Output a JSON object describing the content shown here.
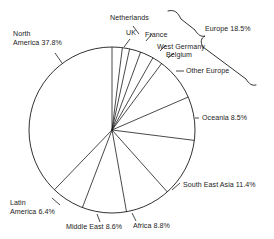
{
  "chart_data": {
    "type": "pie",
    "title": "",
    "subtitle": "",
    "xlabel": "",
    "ylabel": "",
    "legend_position": "none",
    "grid": false,
    "units": "percent",
    "start_angle_deg": 0,
    "direction": "clockwise",
    "categories": [
      "UK",
      "Netherlands",
      "France",
      "West Germany",
      "Belgium",
      "Other Europe",
      "Oceania",
      "South East Asia",
      "Africa",
      "Middle East",
      "Latin America",
      "North America"
    ],
    "values": [
      2.0,
      1.4,
      2.2,
      2.6,
      2.0,
      8.3,
      8.5,
      11.4,
      8.8,
      8.6,
      6.4,
      37.8
    ],
    "total": 100.0,
    "groups": [
      {
        "name": "Europe",
        "value": 18.5,
        "label": "Europe 18.5%",
        "members": [
          "UK",
          "Netherlands",
          "France",
          "West Germany",
          "Belgium",
          "Other Europe"
        ]
      }
    ],
    "annotations": [
      "Netherlands",
      "UK",
      "France",
      "West Germany",
      "Belgium",
      "Other Europe",
      "Europe 18.5%",
      "Oceania 8.5%",
      "South East Asia 11.4%",
      "Africa 8.8%",
      "Middle East 8.6%",
      "Latin America 6.4%",
      "North America 37.8%"
    ]
  },
  "labels": {
    "north_america": "North\nAmerica 37.8%",
    "north_america_line1": "North",
    "north_america_line2": "America 37.8%",
    "netherlands": "Netherlands",
    "uk": "UK",
    "france": "France",
    "west_germany": "West Germany",
    "belgium": "Belgium",
    "other_europe": "Other Europe",
    "europe_group": "Europe 18.5%",
    "oceania": "Oceania 8.5%",
    "south_east_asia": "South East Asia 11.4%",
    "africa": "Africa 8.8%",
    "middle_east": "Middle East 8.6%",
    "latin_america_line1": "Latin",
    "latin_america_line2": "America 6.4%"
  },
  "colors": {
    "background": "#ffffff",
    "stroke": "#1a1a1a",
    "text": "#1c1c1c",
    "slice_fill": "none"
  }
}
